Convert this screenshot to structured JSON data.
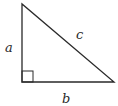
{
  "diagram": {
    "type": "right-triangle",
    "stroke_color": "#2a2a2a",
    "labels": {
      "a": "a",
      "b": "b",
      "c": "c"
    },
    "vertices": {
      "top": [
        22,
        4
      ],
      "right_angle": [
        22,
        82
      ],
      "right": [
        114,
        82
      ]
    },
    "right_angle_marker_size": 11
  }
}
